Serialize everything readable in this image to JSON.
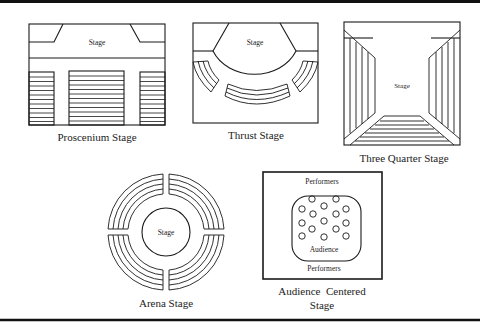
{
  "diagrams": {
    "proscenium": {
      "title": "Proscenium Stage",
      "stage_label": "Stage"
    },
    "thrust": {
      "title": "Thrust Stage",
      "stage_label": "Stage"
    },
    "three_quarter": {
      "title": "Three Quarter Stage",
      "stage_label": "Stage"
    },
    "arena": {
      "title": "Arena Stage",
      "stage_label": "Stage"
    },
    "audience_centered": {
      "title_line1": "Audience  Centered",
      "title_line2": "Stage",
      "performers_top": "Performers",
      "performers_bottom": "Performers",
      "audience_label": "Audience",
      "audience_circle_count": 15
    }
  },
  "colors": {
    "ink": "#1a1a1a",
    "background": "#ffffff"
  }
}
